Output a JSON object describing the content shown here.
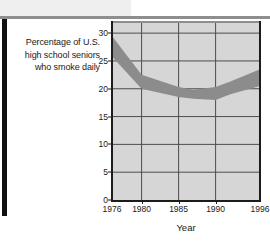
{
  "caption": {
    "lines": [
      "Percentage of U.S.",
      "high school seniors",
      "who smoke daily"
    ]
  },
  "chart_data": {
    "type": "area",
    "title": "",
    "subtitle": "",
    "annotation": "Percentage of U.S. high school seniors who smoke daily",
    "xlabel": "Year",
    "ylabel": "",
    "xlim": [
      1976,
      1996
    ],
    "ylim": [
      0,
      32
    ],
    "grid": true,
    "legend": null,
    "xticks": [
      1976,
      1980,
      1985,
      1990,
      1996
    ],
    "xtick_labels": [
      "1976",
      "1980",
      "1985",
      "1990",
      "1996"
    ],
    "yticks": [
      0,
      5,
      10,
      15,
      20,
      25,
      30
    ],
    "ytick_labels": [
      "0",
      "5",
      "10",
      "15",
      "20",
      "25",
      "30"
    ],
    "band_color": "#8c8c8c",
    "plot_background": "#d6d6d6",
    "gridline_color": "#4d4d4d",
    "axis_color": "#1c1c1c",
    "x": [
      1976,
      1980,
      1985,
      1987,
      1990,
      1992,
      1996
    ],
    "series": [
      {
        "name": "upper",
        "values": [
          29.5,
          22.5,
          20.3,
          19.8,
          20.3,
          21.3,
          23.5
        ]
      },
      {
        "name": "lower",
        "values": [
          25.8,
          20.0,
          18.5,
          18.2,
          18.0,
          19.0,
          20.5
        ]
      }
    ]
  },
  "xaxis": {
    "title": "Year"
  }
}
